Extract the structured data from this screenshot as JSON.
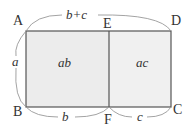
{
  "diagram": {
    "type": "rectangle area decomposition",
    "points": {
      "A": "A",
      "B": "B",
      "C": "C",
      "D": "D",
      "E": "E",
      "F": "F"
    },
    "regions": [
      {
        "name": "ABFE",
        "label": "ab"
      },
      {
        "name": "EFCD",
        "label": "ac"
      }
    ],
    "dimensions": {
      "top": "b+c",
      "left": "a",
      "bottom_left": "b",
      "bottom_right": "c"
    },
    "colors": {
      "fill": "#ececec",
      "stroke": "#555555",
      "brace": "#999999"
    }
  }
}
